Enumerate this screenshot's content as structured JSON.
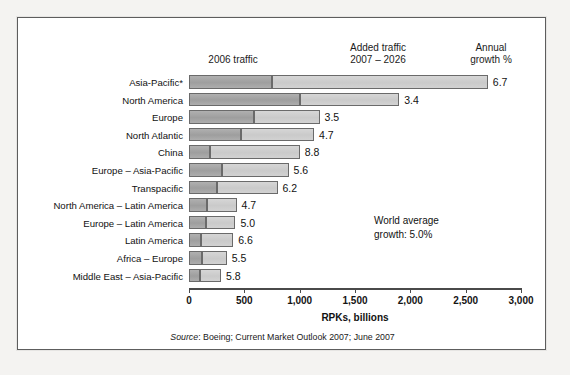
{
  "top_caption": "",
  "figure": {
    "headers": {
      "col_2006": "2006 traffic",
      "col_added_line1": "Added traffic",
      "col_added_line2": "2007 – 2026",
      "col_growth_line1": "Annual",
      "col_growth_line2": "growth %"
    },
    "annotation": {
      "line1": "World average",
      "line2": "growth: 5.0%"
    },
    "source": "Source: Boeing; Current Market Outlook 2007; June 2007",
    "source_prefix": "Source",
    "source_rest": ": Boeing; Current Market Outlook 2007; June 2007"
  },
  "chart_data": {
    "type": "bar",
    "orientation": "horizontal",
    "stacked": true,
    "title": "",
    "xlabel": "RPKs, billions",
    "ylabel": "",
    "xlim": [
      0,
      3000
    ],
    "xticks": [
      0,
      500,
      1000,
      1500,
      2000,
      2500,
      3000
    ],
    "xticklabels": [
      "0",
      "500",
      "1,000",
      "1,500",
      "2,000",
      "2,500",
      "3,000"
    ],
    "grid": false,
    "legend_position": "column-headers",
    "series": [
      {
        "name": "2006 traffic",
        "color": "#a2a2a2",
        "values": [
          750,
          1000,
          590,
          470,
          190,
          300,
          250,
          160,
          150,
          110,
          120,
          100
        ]
      },
      {
        "name": "Added traffic 2007 – 2026",
        "color": "#cfcfcf",
        "values": [
          1950,
          900,
          590,
          660,
          810,
          600,
          550,
          270,
          270,
          290,
          220,
          190
        ]
      }
    ],
    "categories": [
      "Asia-Pacific*",
      "North America",
      "Europe",
      "North Atlantic",
      "China",
      "Europe – Asia-Pacific",
      "Transpacific",
      "North America – Latin America",
      "Europe – Latin America",
      "Latin America",
      "Africa – Europe",
      "Middle East – Asia-Pacific"
    ],
    "totals": [
      2700,
      1900,
      1180,
      1130,
      1000,
      900,
      800,
      430,
      420,
      400,
      340,
      290
    ],
    "annual_growth_pct": [
      "6.7",
      "3.4",
      "3.5",
      "4.7",
      "8.8",
      "5.6",
      "6.2",
      "4.7",
      "5.0",
      "6.6",
      "5.5",
      "5.8"
    ],
    "world_average_growth_pct": "5.0"
  }
}
